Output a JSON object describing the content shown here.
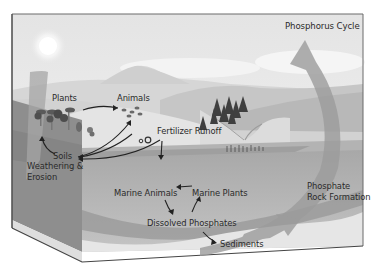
{
  "title": "Phosphorus Cycle",
  "labels": {
    "plants": "Plants",
    "animals": "Animals",
    "fertilizer_runoff": "Fertilizer Runoff",
    "soils": "Soils",
    "weathering_line1": "Weathering &",
    "weathering_line2": "Erosion",
    "marine_animals": "Marine Animals",
    "marine_plants": "Marine Plants",
    "dissolved_phosphates": "Dissolved Phosphates",
    "sediments": "Sediments",
    "rock_formation_line1": "Phosphate",
    "rock_formation_line2": "Rock Formation"
  },
  "colors": {
    "sky": "#e9e9e9",
    "mountain": "#dadada",
    "land": "#c8c8c8",
    "ocean_surface": "#a9a9a9",
    "ocean_deep": "#b4b4b4",
    "box_side": "#8f8f8f",
    "cycle_arrow": "#9a9a9a",
    "text": "#2a2a2a",
    "outline": "#555555"
  }
}
